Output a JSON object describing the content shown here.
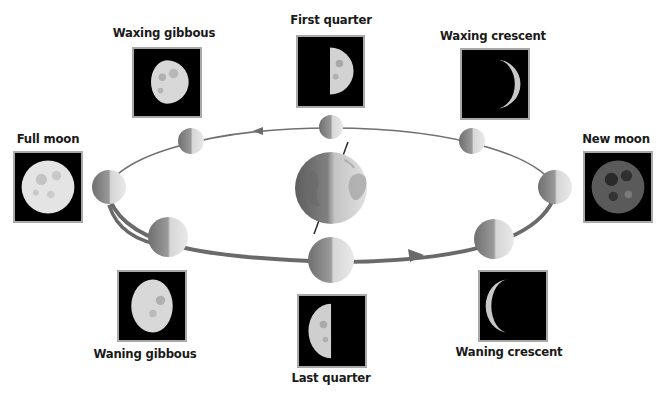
{
  "colors": {
    "background": "#ffffff",
    "orbit": "#6e6e6e",
    "frame_border": "#a9a9a9",
    "frame_fill": "#000000",
    "moon_light": "#e8e8e8",
    "moon_dark": "#7a7a7a",
    "label": "#1a1a1a"
  },
  "center_body": {
    "name": "Earth",
    "shaded_side": "left",
    "axis_tilt": true
  },
  "orbit": {
    "direction": "counterclockwise",
    "arrows": [
      "top (pointing left)",
      "bottom (pointing right)"
    ]
  },
  "phases": [
    {
      "id": "first-quarter",
      "label": "First quarter",
      "position": "top"
    },
    {
      "id": "waxing-gibbous",
      "label": "Waxing gibbous",
      "position": "upper-left"
    },
    {
      "id": "full-moon",
      "label": "Full moon",
      "position": "left"
    },
    {
      "id": "waning-gibbous",
      "label": "Waning gibbous",
      "position": "lower-left"
    },
    {
      "id": "last-quarter",
      "label": "Last quarter",
      "position": "bottom"
    },
    {
      "id": "waning-crescent",
      "label": "Waning crescent",
      "position": "lower-right"
    },
    {
      "id": "new-moon",
      "label": "New moon",
      "position": "right"
    },
    {
      "id": "waxing-crescent",
      "label": "Waxing crescent",
      "position": "upper-right"
    }
  ]
}
